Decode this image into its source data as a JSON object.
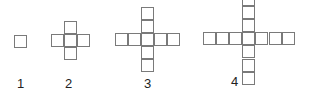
{
  "figures": [
    {
      "label": "1",
      "cells": [
        [
          0,
          0
        ]
      ]
    },
    {
      "label": "2",
      "cells": [
        [
          1,
          0
        ],
        [
          0,
          1
        ],
        [
          1,
          1
        ],
        [
          2,
          1
        ],
        [
          1,
          2
        ]
      ]
    },
    {
      "label": "3",
      "cells": [
        [
          2,
          0
        ],
        [
          2,
          1
        ],
        [
          0,
          2
        ],
        [
          1,
          2
        ],
        [
          2,
          2
        ],
        [
          3,
          2
        ],
        [
          4,
          2
        ],
        [
          2,
          3
        ],
        [
          2,
          4
        ]
      ]
    },
    {
      "label": "4",
      "cells": [
        [
          3,
          0
        ],
        [
          3,
          1
        ],
        [
          3,
          2
        ],
        [
          0,
          3
        ],
        [
          1,
          3
        ],
        [
          2,
          3
        ],
        [
          3,
          3
        ],
        [
          4,
          3
        ],
        [
          5,
          3
        ],
        [
          6,
          3
        ],
        [
          3,
          4
        ],
        [
          3,
          5
        ],
        [
          3,
          6
        ]
      ]
    }
  ],
  "colors": {
    "line": "#7a7a7a",
    "label": "#222222"
  }
}
